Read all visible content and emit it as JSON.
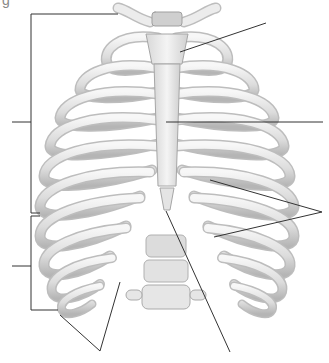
{
  "diagram": {
    "corner_glyph": "g",
    "colors": {
      "bone_light": "#f2f2f2",
      "bone_mid": "#d9d9d9",
      "bone_shadow": "#a8a8a8",
      "leader_line": "#333333",
      "background": "#ffffff"
    },
    "labels": [
      {
        "id": "manubrium",
        "text": "",
        "pointer": "line from manubrium to right"
      },
      {
        "id": "sternum-body",
        "text": "",
        "pointer": "horizontal line from sternum body to right"
      },
      {
        "id": "costal-cartilages",
        "text": "",
        "pointer": "V-shaped lines to costal cartilages, right"
      },
      {
        "id": "xiphoid-process",
        "text": "",
        "pointer": "line from xiphoid process down"
      },
      {
        "id": "floating-ribs",
        "text": "",
        "pointer": "V-shaped lines to lower ribs, bottom"
      },
      {
        "id": "true-ribs",
        "text": "",
        "pointer": "upper left bracket"
      },
      {
        "id": "false-ribs",
        "text": "",
        "pointer": "lower left bracket"
      }
    ]
  }
}
